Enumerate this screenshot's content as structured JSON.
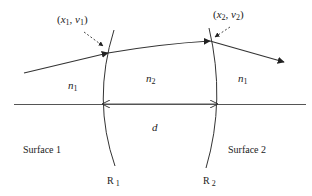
{
  "diagram": {
    "points": {
      "p1": {
        "label_open": "(",
        "x": "x",
        "x_sub": "1",
        "comma": ", ",
        "v": "v",
        "v_sub": "1",
        "label_close": ")"
      },
      "p2": {
        "label_open": "(",
        "x": "x",
        "x_sub": "2",
        "comma": ", ",
        "v": "v",
        "v_sub": "2",
        "label_close": ")"
      }
    },
    "media": {
      "left": {
        "symbol": "n",
        "sub": "1"
      },
      "middle": {
        "symbol": "n",
        "sub": "2"
      },
      "right": {
        "symbol": "n",
        "sub": "1"
      }
    },
    "thickness": {
      "symbol": "d"
    },
    "surfaces": [
      {
        "label": "Surface 1",
        "radius_symbol": "R",
        "radius_sub": "1"
      },
      {
        "label": "Surface 2",
        "radius_symbol": "R",
        "radius_sub": "2"
      }
    ],
    "colors": {
      "stroke": "#333333",
      "background": "#ffffff"
    }
  }
}
